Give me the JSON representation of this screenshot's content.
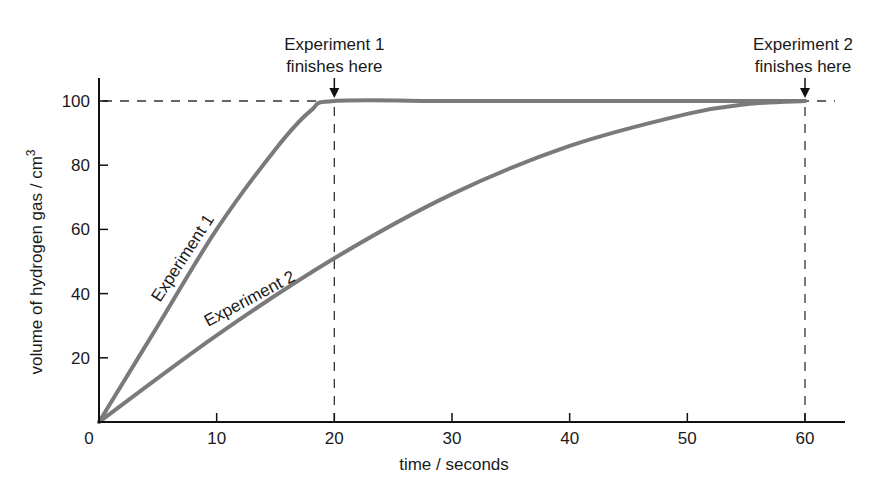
{
  "chart_data": {
    "type": "line",
    "title": "",
    "xlabel": "time / seconds",
    "ylabel": "volume of hydrogen gas / cm³",
    "ylabel_main": "volume of hydrogen gas / cm",
    "ylabel_superscript": "3",
    "xlim": [
      0,
      63
    ],
    "ylim": [
      0,
      107
    ],
    "x_ticks": [
      0,
      10,
      20,
      30,
      40,
      50,
      60
    ],
    "x_tick_labels": [
      "0",
      "10",
      "20",
      "30",
      "40",
      "50",
      "60"
    ],
    "y_ticks": [
      20,
      40,
      60,
      80,
      100
    ],
    "y_tick_labels": [
      "20",
      "40",
      "60",
      "80",
      "100"
    ],
    "grid": false,
    "legend": "none (inline curve labels)",
    "series": [
      {
        "name": "Experiment 1",
        "color": "#7a7a7a",
        "x": [
          0,
          5,
          10,
          15,
          18,
          20,
          30,
          40,
          50,
          60
        ],
        "y": [
          0,
          30,
          60,
          85,
          97,
          100,
          100,
          100,
          100,
          100
        ]
      },
      {
        "name": "Experiment 2",
        "color": "#7a7a7a",
        "x": [
          0,
          10,
          20,
          30,
          40,
          50,
          55,
          60
        ],
        "y": [
          0,
          27,
          51,
          71,
          86,
          96,
          99,
          100
        ]
      }
    ],
    "reference_lines": [
      {
        "orientation": "horizontal",
        "value": 100,
        "style": "dashed"
      },
      {
        "orientation": "vertical",
        "value": 20,
        "style": "dashed"
      },
      {
        "orientation": "vertical",
        "value": 60,
        "style": "dashed"
      }
    ],
    "annotations": [
      {
        "line1": "Experiment 1",
        "line2": "finishes here",
        "x": 20,
        "y": 100,
        "arrow": "down"
      },
      {
        "line1": "Experiment 2",
        "line2": "finishes here",
        "x": 60,
        "y": 100,
        "arrow": "down"
      }
    ],
    "curve_labels": [
      {
        "text": "Experiment 1",
        "series": "Experiment 1"
      },
      {
        "text": "Experiment 2",
        "series": "Experiment 2"
      }
    ]
  }
}
